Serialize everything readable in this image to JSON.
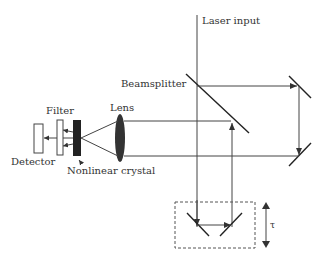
{
  "diagram": {
    "labels": {
      "laser_input": "Laser input",
      "beamsplitter": "Beamsplitter",
      "lens": "Lens",
      "filter": "Filter",
      "detector": "Detector",
      "crystal": "Nonlinear crystal",
      "delay": "τ"
    },
    "components": [
      "Laser input",
      "Beamsplitter",
      "Mirror (top right)",
      "Mirror (bottom right)",
      "Delay stage (two mirrors)",
      "Lens",
      "Nonlinear crystal",
      "Filter",
      "Detector"
    ],
    "colors": {
      "line": "#444444",
      "crystal": "#222222",
      "lens": "#333333",
      "background": "#ffffff"
    }
  }
}
